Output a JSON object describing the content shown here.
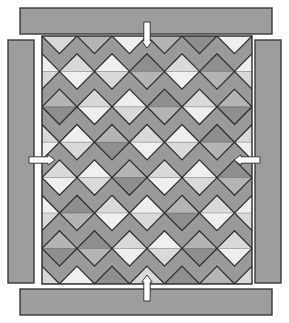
{
  "figure": {
    "name": "quilt-block-layout-diagram",
    "canvas": {
      "width": 289,
      "height": 323,
      "background": "#ffffff"
    }
  },
  "palette": {
    "border_bar_fill": "#9d9d9d",
    "border_bar_stroke": "#3a3a3a",
    "panel_fill": "#9a9a9a",
    "panel_stroke": "#2b2b2b",
    "lattice_stroke": "#333333",
    "shade_dark": "#8e8e8e",
    "shade_mid": "#b4b4b4",
    "shade_light": "#d9d9d9",
    "shade_pale": "#efefef",
    "arrow_fill": "#ffffff",
    "arrow_stroke": "#2b2b2b"
  },
  "borders": [
    {
      "id": "top-border-bar",
      "label": "top border strip",
      "x": 20,
      "y": 8,
      "w": 252,
      "h": 26
    },
    {
      "id": "bottom-border-bar",
      "label": "bottom border strip",
      "x": 20,
      "y": 289,
      "w": 252,
      "h": 26
    },
    {
      "id": "left-border-bar",
      "label": "left border strip",
      "x": 8,
      "y": 40,
      "w": 26,
      "h": 243
    },
    {
      "id": "right-border-bar",
      "label": "right border strip",
      "x": 255,
      "y": 40,
      "w": 26,
      "h": 243
    }
  ],
  "panel": {
    "x": 42,
    "y": 36,
    "w": 210,
    "h": 248
  },
  "lattice": {
    "cols": 6,
    "rows": 7,
    "cell_w": 35,
    "cell_h": 35.4,
    "origin_x": 42,
    "origin_y": 36,
    "description": "on-point square lattice; each diamond split horizontally into an upper and lower triangle"
  },
  "arrows": [
    {
      "id": "arrow-top",
      "label": "top seam marker",
      "direction": "down",
      "x": 147,
      "y": 22,
      "len": 26
    },
    {
      "id": "arrow-bottom",
      "label": "bottom seam marker",
      "direction": "up",
      "x": 147,
      "y": 275,
      "len": 26
    },
    {
      "id": "arrow-left",
      "label": "left seam marker",
      "direction": "right",
      "x": 29,
      "y": 160,
      "len": 26
    },
    {
      "id": "arrow-right",
      "label": "right seam marker",
      "direction": "left",
      "x": 234,
      "y": 160,
      "len": 26
    }
  ],
  "chart_data": {
    "type": "heatmap",
    "title": "",
    "xlabel": "",
    "ylabel": "",
    "grid": true,
    "legend": "none",
    "note": "Diagonal half-square-triangle quilt layout. Each cell value pair = [upper triangle tone, lower triangle tone] on a 0-3 gray scale where 0=dark, 1=mid, 2=light, 3=pale.",
    "tone_scale": [
      "dark",
      "mid",
      "light",
      "pale"
    ],
    "categories": [
      "c1",
      "c2",
      "c3",
      "c4",
      "c5",
      "c6"
    ],
    "rows": [
      "r1",
      "r2",
      "r3",
      "r4",
      "r5",
      "r6",
      "r7"
    ],
    "upper": [
      [
        3,
        0,
        2,
        0,
        1,
        2
      ],
      [
        2,
        3,
        0,
        2,
        0,
        3
      ],
      [
        1,
        2,
        3,
        0,
        2,
        1
      ],
      [
        3,
        1,
        2,
        3,
        0,
        2
      ],
      [
        2,
        3,
        1,
        2,
        3,
        0
      ],
      [
        0,
        2,
        3,
        1,
        2,
        3
      ],
      [
        1,
        0,
        2,
        3,
        1,
        2
      ]
    ],
    "lower": [
      [
        2,
        1,
        3,
        1,
        0,
        3
      ],
      [
        3,
        2,
        1,
        3,
        1,
        2
      ],
      [
        0,
        3,
        2,
        1,
        3,
        0
      ],
      [
        2,
        0,
        3,
        2,
        1,
        3
      ],
      [
        3,
        2,
        0,
        3,
        2,
        1
      ],
      [
        1,
        3,
        2,
        0,
        3,
        2
      ],
      [
        0,
        1,
        3,
        2,
        0,
        3
      ]
    ]
  }
}
